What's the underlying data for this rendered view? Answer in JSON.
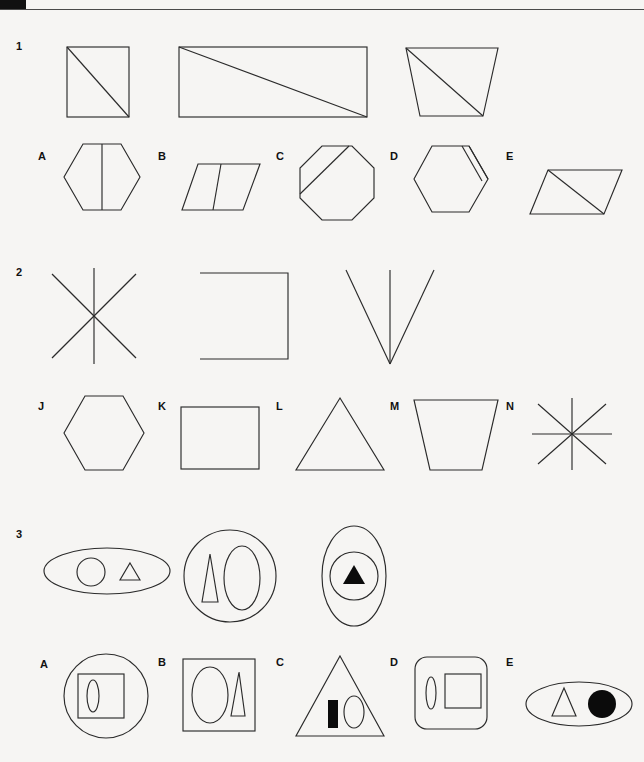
{
  "page": {
    "background_color": "#f6f5f3",
    "ink_color": "#2b2b2b",
    "top_rule_cap_color": "#111111"
  },
  "questions": [
    {
      "number": "1",
      "prompt_figures": [
        {
          "name": "square-with-diagonal",
          "description": "square with diagonal from top-left to bottom-right"
        },
        {
          "name": "wide-rectangle-with-diagonal",
          "description": "wide rectangle with diagonal from top-left to bottom-right"
        },
        {
          "name": "trapezoid-with-diagonal",
          "description": "downward tapering trapezoid with diagonal from top-left to bottom-right"
        }
      ],
      "options": [
        {
          "letter": "A",
          "name": "hexagon-with-vertical-line",
          "description": "hexagon split by a vertical line"
        },
        {
          "letter": "B",
          "name": "parallelogram-with-vertical-line",
          "description": "parallelogram split by a vertical line"
        },
        {
          "letter": "C",
          "name": "octagon-with-corner-chord",
          "description": "octagon with chord cutting the upper-left corner"
        },
        {
          "letter": "D",
          "name": "hexagon-with-edge-chord",
          "description": "hexagon with a chord near the right edge"
        },
        {
          "letter": "E",
          "name": "parallelogram-with-diagonal",
          "description": "parallelogram with a diagonal"
        }
      ]
    },
    {
      "number": "2",
      "prompt_figures": [
        {
          "name": "six-line-asterisk",
          "description": "asterisk made of three crossing straight lines (six rays)"
        },
        {
          "name": "open-square-left",
          "description": "square outline open on the left side"
        },
        {
          "name": "v-with-vertical-line",
          "description": "V shape with a vertical line down the middle"
        }
      ],
      "options": [
        {
          "letter": "J",
          "name": "hexagon",
          "description": "plain hexagon"
        },
        {
          "letter": "K",
          "name": "rectangle",
          "description": "plain rectangle"
        },
        {
          "letter": "L",
          "name": "triangle",
          "description": "plain equilateral triangle"
        },
        {
          "letter": "M",
          "name": "trapezoid",
          "description": "downward tapering trapezoid"
        },
        {
          "letter": "N",
          "name": "eight-line-asterisk",
          "description": "asterisk made of four crossing straight lines (eight rays)"
        }
      ]
    },
    {
      "number": "3",
      "prompt_figures": [
        {
          "name": "wide-ellipse-with-circle-and-triangle",
          "description": "wide ellipse containing a small circle and a small triangle"
        },
        {
          "name": "circle-with-triangle-and-ellipse",
          "description": "circle containing a narrow triangle and a tall ellipse"
        },
        {
          "name": "tall-ellipse-with-circle-and-filled-triangle",
          "description": "tall ellipse containing a circle holding a filled black triangle"
        }
      ],
      "options": [
        {
          "letter": "A",
          "name": "circle-with-square-and-ellipse",
          "description": "circle containing a square which contains a small vertical ellipse"
        },
        {
          "letter": "B",
          "name": "square-with-ellipse-and-triangle",
          "description": "square containing a tall ellipse and a narrow triangle"
        },
        {
          "letter": "C",
          "name": "triangle-with-bar-and-ellipse",
          "description": "triangle containing a filled black bar and a small ellipse"
        },
        {
          "letter": "D",
          "name": "rounded-square-with-ellipse-and-square",
          "description": "rounded square containing a small vertical ellipse and a square"
        },
        {
          "letter": "E",
          "name": "ellipse-with-triangle-and-filled-circle",
          "description": "wide ellipse containing a triangle and a filled black circle"
        }
      ]
    }
  ]
}
